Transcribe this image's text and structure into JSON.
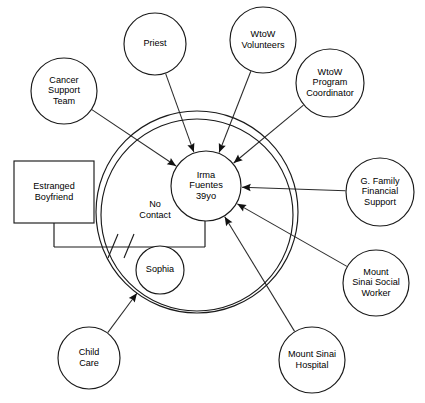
{
  "diagram": {
    "type": "ecomap",
    "watermark": "",
    "center": {
      "id": "irma",
      "shape": "circle",
      "lines": [
        "Irma",
        "Fuentes",
        "39yo"
      ],
      "cx": 206,
      "cy": 186,
      "r": 35
    },
    "rings": [
      {
        "id": "inner-system-boundary",
        "cx": 197,
        "cy": 215,
        "r": 96
      },
      {
        "id": "outer-system-boundary",
        "cx": 197,
        "cy": 212,
        "r": 101
      }
    ],
    "household": {
      "partner": {
        "id": "estranged-boyfriend",
        "shape": "rect",
        "lines": [
          "Estranged",
          "Boyfriend"
        ],
        "x": 14,
        "y": 161,
        "w": 80,
        "h": 62
      },
      "child": {
        "id": "sophia",
        "shape": "circle",
        "lines": [
          "Sophia"
        ],
        "cx": 160,
        "cy": 270,
        "r": 24
      },
      "relationship_label": {
        "lines": [
          "No",
          "Contact"
        ],
        "x": 155,
        "y": 207
      },
      "relationship_status": "cut-off"
    },
    "externals": [
      {
        "id": "cancer-support-team",
        "shape": "circle",
        "lines": [
          "Cancer",
          "Support",
          "Team"
        ],
        "cx": 64,
        "cy": 91,
        "r": 33,
        "arrow": true
      },
      {
        "id": "priest",
        "shape": "circle",
        "lines": [
          "Priest"
        ],
        "cx": 155,
        "cy": 44,
        "r": 31,
        "arrow": true
      },
      {
        "id": "wtow-volunteers",
        "shape": "circle",
        "lines": [
          "WtoW",
          "Volunteers"
        ],
        "cx": 263,
        "cy": 40,
        "r": 33,
        "arrow": true
      },
      {
        "id": "wtow-program-coordinator",
        "shape": "circle",
        "lines": [
          "WtoW",
          "Program",
          "Coordinator"
        ],
        "cx": 330,
        "cy": 83,
        "r": 34,
        "arrow": true
      },
      {
        "id": "g-family-financial-support",
        "shape": "circle",
        "lines": [
          "G. Family",
          "Financial",
          "Support"
        ],
        "cx": 380,
        "cy": 192,
        "r": 34,
        "arrow": true
      },
      {
        "id": "mount-sinai-social-worker",
        "shape": "circle",
        "lines": [
          "Mount",
          "Sinai Social",
          "Worker"
        ],
        "cx": 376,
        "cy": 283,
        "r": 33,
        "arrow": true
      },
      {
        "id": "mount-sinai-hospital",
        "shape": "circle",
        "lines": [
          "Mount Sinai",
          "Hospital"
        ],
        "cx": 312,
        "cy": 360,
        "r": 33,
        "arrow": true
      },
      {
        "id": "child-care",
        "shape": "circle",
        "lines": [
          "Child",
          "Care"
        ],
        "cx": 89,
        "cy": 358,
        "r": 31,
        "arrow": true
      }
    ]
  }
}
